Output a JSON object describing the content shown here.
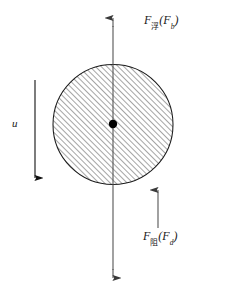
{
  "figure": {
    "background_color": "#ffffff",
    "line_color": "#1a1a1a",
    "width": 225,
    "height": 291
  },
  "body": {
    "shape": "circle",
    "label": "sphere-particle",
    "center_x": 113,
    "center_y": 124.5,
    "radius": 60,
    "fill_pattern": "diagonal-hatch",
    "hatch_angle_deg": 45,
    "hatch_spacing_px": 4,
    "stroke_color": "#1a1a1a",
    "stroke_width": 1
  },
  "center_point": {
    "name": "center-of-mass",
    "x": 113,
    "y": 124,
    "radius": 4.2,
    "color": "#000000"
  },
  "axis": {
    "name": "vertical-force-axis",
    "x": 113,
    "y_top": 18,
    "y_bottom": 278,
    "arrow_top": "up",
    "arrow_bottom": "down",
    "color": "#4a4a4a",
    "width": 1.1
  },
  "arrows": [
    {
      "id": "velocity-arrow",
      "direction": "down",
      "x": 35,
      "y_start": 80,
      "y_end": 178,
      "color": "#1a1a1a",
      "width": 1.1
    },
    {
      "id": "drag-arrow",
      "direction": "up",
      "x": 158,
      "y_start": 228,
      "y_end": 190,
      "color": "#4a4a4a",
      "width": 1.1
    }
  ],
  "labels": {
    "buoyancy": {
      "symbol": "F",
      "subscript_cjk": "浮",
      "open_paren": "(",
      "paren_symbol": "F",
      "paren_subscript": "b",
      "close_paren": ")",
      "full_text": "F浮(Fb)",
      "meaning": "buoyant-force"
    },
    "drag": {
      "symbol": "F",
      "subscript_cjk": "阻",
      "open_paren": "(",
      "paren_symbol": "F",
      "paren_subscript": "d",
      "close_paren": ")",
      "full_text": "F阻(Fd)",
      "meaning": "drag-force"
    },
    "velocity": {
      "symbol": "u",
      "meaning": "settling-velocity"
    }
  }
}
